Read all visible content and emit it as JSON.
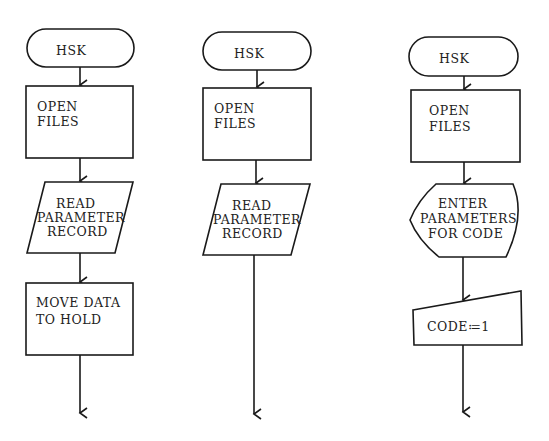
{
  "diagram": {
    "type": "flowchart-set",
    "flowcharts": [
      {
        "id": "left",
        "steps": [
          {
            "shape": "terminal",
            "lines": [
              "HSK"
            ]
          },
          {
            "shape": "process",
            "lines": [
              "OPEN",
              "FILES"
            ]
          },
          {
            "shape": "input-output",
            "lines": [
              "READ",
              "PARAMETER",
              "RECORD"
            ]
          },
          {
            "shape": "process",
            "lines": [
              "MOVE DATA",
              "TO HOLD"
            ]
          }
        ]
      },
      {
        "id": "middle",
        "steps": [
          {
            "shape": "terminal",
            "lines": [
              "HSK"
            ]
          },
          {
            "shape": "process",
            "lines": [
              "OPEN",
              "FILES"
            ]
          },
          {
            "shape": "input-output",
            "lines": [
              "READ",
              "PARAMETER",
              "RECORD"
            ]
          }
        ]
      },
      {
        "id": "right",
        "steps": [
          {
            "shape": "terminal",
            "lines": [
              "HSK"
            ]
          },
          {
            "shape": "process",
            "lines": [
              "OPEN",
              "FILES"
            ]
          },
          {
            "shape": "display",
            "lines": [
              "ENTER",
              "PARAMETERS",
              "FOR CODE"
            ]
          },
          {
            "shape": "manual-input",
            "lines": [
              "CODE≔1"
            ]
          }
        ]
      }
    ]
  }
}
